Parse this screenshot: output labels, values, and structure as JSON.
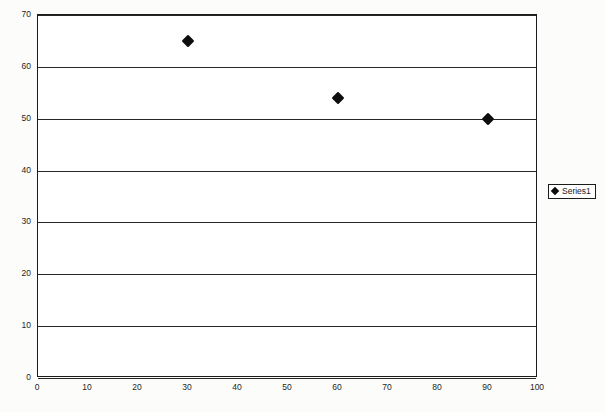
{
  "chart_data": {
    "type": "scatter",
    "title": "",
    "xlabel": "",
    "ylabel": "",
    "xlim": [
      0,
      100
    ],
    "ylim": [
      0,
      70
    ],
    "x_ticks": [
      0,
      10,
      20,
      30,
      40,
      50,
      60,
      70,
      80,
      90,
      100
    ],
    "y_ticks": [
      0,
      10,
      20,
      30,
      40,
      50,
      60,
      70
    ],
    "grid": "horizontal",
    "legend_position": "right",
    "marker": "diamond",
    "marker_color": "#0d0d0d",
    "plot_background": "#ffffff",
    "plot_border_color": "#1b1b1b",
    "series": [
      {
        "name": "Series1",
        "points": [
          {
            "x": 30,
            "y": 65
          },
          {
            "x": 60,
            "y": 54
          },
          {
            "x": 90,
            "y": 50
          }
        ]
      }
    ]
  },
  "legend": {
    "entries": [
      {
        "label": "Series1"
      }
    ]
  }
}
